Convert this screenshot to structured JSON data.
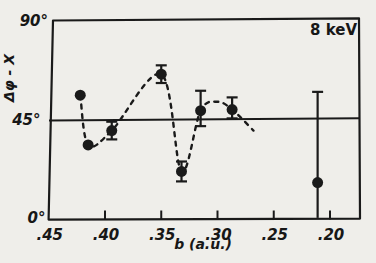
{
  "colors": {
    "ink": "#1a1a1a",
    "paper": "#efeeea"
  },
  "annotation": "8 keV",
  "chart_data": {
    "type": "scatter",
    "title": "",
    "annotation": "8 keV",
    "xlabel": "b (a.u.)",
    "ylabel": "Δφ - X",
    "x_axis": {
      "direction": "reversed",
      "tick_values": [
        0.45,
        0.4,
        0.35,
        0.3,
        0.25,
        0.2
      ],
      "tick_labels": [
        ".45",
        ".40",
        ".35",
        ".30",
        ".25",
        ".20"
      ],
      "tick_marks": [
        false,
        true,
        true,
        true,
        true,
        true
      ],
      "range_left": 0.452,
      "range_right": 0.173
    },
    "y_axis": {
      "unit": "degrees",
      "tick_values": [
        0,
        45,
        90
      ],
      "tick_labels": [
        "0°",
        "45°",
        "90°"
      ],
      "range": [
        0,
        90
      ]
    },
    "reference_line_y": 45,
    "points": [
      {
        "b": 0.422,
        "angle": 56.0,
        "err_up": null,
        "err_down": null
      },
      {
        "b": 0.415,
        "angle": 33.5,
        "err_up": null,
        "err_down": null
      },
      {
        "b": 0.394,
        "angle": 40.0,
        "err_up": 4.0,
        "err_down": 4.0
      },
      {
        "b": 0.35,
        "angle": 65.5,
        "err_up": 4.0,
        "err_down": 4.0
      },
      {
        "b": 0.332,
        "angle": 21.5,
        "err_up": 4.5,
        "err_down": 4.5
      },
      {
        "b": 0.315,
        "angle": 49.0,
        "err_up": 9.0,
        "err_down": 7.0
      },
      {
        "b": 0.287,
        "angle": 49.5,
        "err_up": 5.5,
        "err_down": 4.0
      },
      {
        "b": 0.211,
        "angle": 16.5,
        "err_up": 41.0,
        "err_down": 16.0,
        "cap_down": false
      }
    ],
    "dashed_curve": [
      [
        0.422,
        56.0
      ],
      [
        0.415,
        33.5
      ],
      [
        0.394,
        40.0
      ],
      [
        0.35,
        65.5
      ],
      [
        0.332,
        21.5
      ],
      [
        0.315,
        49.0
      ],
      [
        0.3,
        53.0
      ],
      [
        0.287,
        49.5
      ],
      [
        0.268,
        40.0
      ]
    ]
  }
}
